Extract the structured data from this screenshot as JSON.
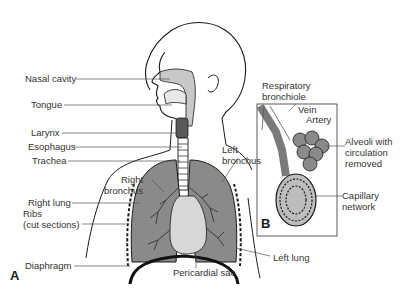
{
  "figure": {
    "panels": [
      {
        "id": "A",
        "label": "A"
      },
      {
        "id": "B",
        "label": "B"
      }
    ],
    "colors": {
      "lung_fill": "#8a8a8a",
      "airway_fill": "#c8c8c8",
      "pericardial_fill": "#d8d8d8",
      "line": "#1a1a1a",
      "text": "#333333"
    }
  },
  "labels_left": {
    "nasal_cavity": "Nasal cavity",
    "tongue": "Tongue",
    "larynx": "Larynx",
    "esophagus": "Esophagus",
    "trachea": "Trachea",
    "right_lung": "Right lung",
    "ribs": "Ribs\n(cut sections)",
    "diaphragm": "Diaphragm"
  },
  "labels_center": {
    "right_bronchus": "Right\nbronchus",
    "left_bronchus": "Left\nbronchus",
    "pericardial_sac": "Pericardial sac",
    "left_lung": "Left lung"
  },
  "labels_inset": {
    "respiratory_bronchiole": "Respiratory\nbronchiole",
    "vein": "Vein",
    "artery": "Artery",
    "alveoli": "Alveoli with\ncirculation\nremoved",
    "capillary_network": "Capillary\nnetwork"
  }
}
